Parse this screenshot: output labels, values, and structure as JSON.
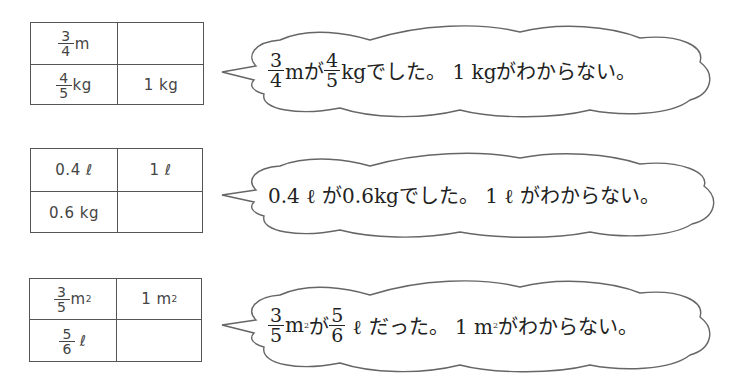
{
  "problems": [
    {
      "table": {
        "r1c1": {
          "num": "3",
          "den": "4",
          "unit": "m"
        },
        "r1c2": "",
        "r2c1": {
          "num": "4",
          "den": "5",
          "unit": "kg"
        },
        "r2c2": "1 kg"
      },
      "bubble": {
        "f1": {
          "num": "3",
          "den": "4"
        },
        "t1": "mが",
        "f2": {
          "num": "4",
          "den": "5"
        },
        "t2": "kgでした。 1 kgがわからない。"
      }
    },
    {
      "table": {
        "r1c1": "0.4 ℓ",
        "r1c2": "1 ℓ",
        "r2c1": "0.6 kg",
        "r2c2": ""
      },
      "bubble": {
        "text": "0.4 ℓ が0.6kgでした。 1 ℓ がわからない。"
      }
    },
    {
      "table": {
        "r1c1": {
          "num": "3",
          "den": "5",
          "unit": "m",
          "sup": "2"
        },
        "r1c2": {
          "unit": "1 m",
          "sup": "2"
        },
        "r2c1": {
          "num": "5",
          "den": "6",
          "unit": "ℓ"
        },
        "r2c2": ""
      },
      "bubble": {
        "f1": {
          "num": "3",
          "den": "5"
        },
        "t1": "m",
        "sup1": "2",
        "t1b": "が",
        "f2": {
          "num": "5",
          "den": "6"
        },
        "t2": " ℓ だった。 1 m",
        "sup2": "2",
        "t3": "がわからない。"
      }
    }
  ]
}
